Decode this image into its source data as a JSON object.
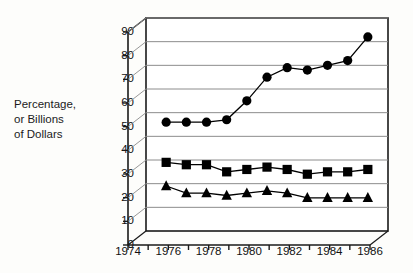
{
  "chart_data": {
    "type": "line",
    "title": "",
    "subtitle": "",
    "xlabel": "",
    "ylabel": "Percentage, or Billions of Dollars",
    "ylabel_lines": [
      "Percentage,",
      "or Billions",
      "of Dollars"
    ],
    "xlim": [
      1974,
      1986
    ],
    "ylim": [
      0,
      90
    ],
    "ytick_values": [
      0,
      10,
      20,
      30,
      40,
      50,
      60,
      70,
      80,
      90
    ],
    "ytick_labels": [
      "0",
      "10",
      "20",
      "30",
      "40",
      "50",
      "60",
      "70",
      "80",
      "90"
    ],
    "xtick_labels": [
      "1974",
      "1976",
      "1978",
      "1980",
      "1982",
      "1984",
      "1986"
    ],
    "xtick_values": [
      1974,
      1976,
      1978,
      1980,
      1982,
      1984,
      1986
    ],
    "xminor_values": [
      1974,
      1975,
      1976,
      1977,
      1978,
      1979,
      1980,
      1981,
      1982,
      1983,
      1984,
      1985,
      1986
    ],
    "grid": "horizontal",
    "legend": "none",
    "style": "3d-skewed-frame",
    "x": [
      1975,
      1976,
      1977,
      1978,
      1979,
      1980,
      1981,
      1982,
      1983,
      1984,
      1985
    ],
    "series": [
      {
        "name": "circle-series",
        "marker": "circle",
        "color": "#000000",
        "values": [
          46,
          46,
          46,
          47,
          55,
          65,
          69,
          68,
          70,
          72,
          82
        ]
      },
      {
        "name": "square-series",
        "marker": "square",
        "color": "#000000",
        "values": [
          29,
          28,
          28,
          25,
          26,
          27,
          26,
          24,
          25,
          25,
          26
        ]
      },
      {
        "name": "triangle-series",
        "marker": "triangle",
        "color": "#000000",
        "values": [
          19,
          16,
          16,
          15,
          16,
          17,
          16,
          14,
          14,
          14,
          14
        ]
      }
    ]
  },
  "colors": {
    "axis": "#1a1a1a",
    "grid": "#8c8c8c",
    "marker": "#000000",
    "text": "#111111",
    "background": "#fdfdfb"
  }
}
